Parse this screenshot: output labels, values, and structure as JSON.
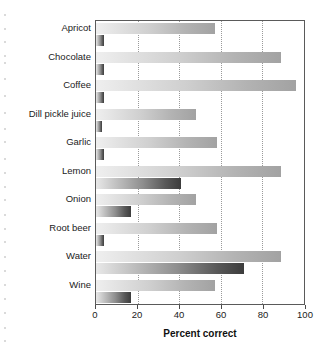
{
  "chart_data": {
    "type": "bar",
    "orientation": "horizontal",
    "title": "",
    "xlabel": "Percent correct",
    "ylabel": "",
    "xlim": [
      0,
      100
    ],
    "xticks": [
      0,
      20,
      40,
      60,
      80,
      100
    ],
    "xtick_labels": [
      "0",
      "20",
      "40",
      "60",
      "80",
      "100"
    ],
    "grid": "vertical-dotted",
    "legend": "none",
    "categories": [
      "Apricot",
      "Chocolate",
      "Coffee",
      "Dill pickle juice",
      "Garlic",
      "Lemon",
      "Onion",
      "Root beer",
      "Water",
      "Wine"
    ],
    "series": [
      {
        "name": "light-bar",
        "shading": "light-gray-gradient",
        "values": [
          57,
          89,
          96,
          48,
          58,
          89,
          48,
          58,
          89,
          57
        ]
      },
      {
        "name": "dark-bar",
        "shading": "dark-gray-gradient",
        "values": [
          4,
          4,
          4,
          3,
          4,
          41,
          17,
          4,
          71,
          17
        ]
      }
    ]
  },
  "axis": {
    "x_title": "Percent correct"
  }
}
